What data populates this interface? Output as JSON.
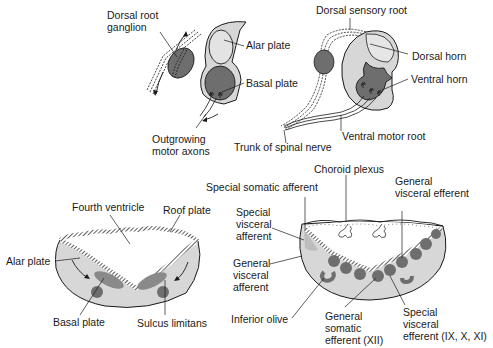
{
  "colors": {
    "light_fill": "#d7d7d7",
    "mid_fill": "#c4c4c4",
    "dark_fill": "#6e6e6e",
    "outline": "#1a1a1a",
    "background": "#ffffff"
  },
  "panels": {
    "top_left": {
      "labels": {
        "dorsal_root_ganglion": "Dorsal root\nganglion",
        "alar_plate": "Alar plate",
        "basal_plate": "Basal plate",
        "outgrowing_motor_axons": "Outgrowing\nmotor axons"
      }
    },
    "top_right": {
      "labels": {
        "dorsal_sensory_root": "Dorsal sensory root",
        "dorsal_horn": "Dorsal horn",
        "ventral_horn": "Ventral horn",
        "ventral_motor_root": "Ventral motor root",
        "trunk_of_spinal_nerve": "Trunk of spinal nerve"
      }
    },
    "bottom_left": {
      "labels": {
        "fourth_ventricle": "Fourth ventricle",
        "roof_plate": "Roof plate",
        "alar_plate": "Alar plate",
        "basal_plate": "Basal plate",
        "sulcus_limitans": "Sulcus limitans"
      }
    },
    "bottom_right": {
      "labels": {
        "choroid_plexus": "Choroid plexus",
        "special_somatic_afferent": "Special somatic afferent",
        "general_visceral_efferent": "General\nvisceral efferent",
        "special_visceral_afferent": "Special\nvisceral\nafferent",
        "general_visceral_afferent": "General\nvisceral\nafferent",
        "inferior_olive": "Inferior olive",
        "general_somatic_efferent": "General\nsomatic\nefferent (XII)",
        "special_visceral_efferent": "Special\nvisceral\nefferent (IX, X, XI)"
      }
    }
  }
}
